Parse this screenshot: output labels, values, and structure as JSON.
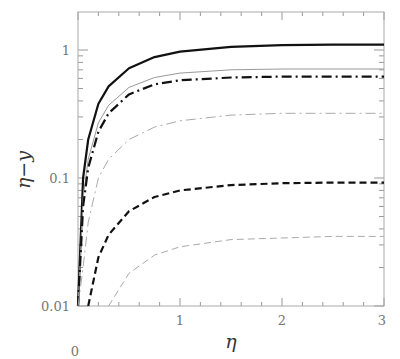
{
  "chart_data": {
    "type": "line",
    "title": "",
    "xlabel": "η",
    "ylabel": "η−y",
    "xlim": [
      0,
      3
    ],
    "ylim": [
      0.01,
      1.8
    ],
    "yscale": "log",
    "grid": false,
    "legend": null,
    "x_ticks": [
      "0",
      "1",
      "2",
      "3"
    ],
    "y_ticks": [
      "0.01",
      "0.1",
      "1"
    ],
    "x": [
      0.0,
      0.05,
      0.1,
      0.2,
      0.3,
      0.5,
      0.75,
      1.0,
      1.5,
      2.0,
      2.5,
      3.0
    ],
    "series": [
      {
        "name": "thick solid",
        "style": "solid",
        "color": "#111111",
        "width": 2.2,
        "values": [
          0.01,
          0.1,
          0.2,
          0.38,
          0.52,
          0.72,
          0.88,
          0.97,
          1.06,
          1.09,
          1.1,
          1.1
        ]
      },
      {
        "name": "thin solid",
        "style": "solid",
        "color": "#999999",
        "width": 1,
        "values": [
          0.01,
          0.07,
          0.14,
          0.27,
          0.37,
          0.51,
          0.61,
          0.66,
          0.7,
          0.71,
          0.71,
          0.71
        ]
      },
      {
        "name": "thick dash-dot",
        "style": "dashdot",
        "color": "#111111",
        "width": 2.2,
        "values": [
          0.01,
          0.06,
          0.12,
          0.23,
          0.32,
          0.45,
          0.54,
          0.58,
          0.61,
          0.62,
          0.62,
          0.62
        ]
      },
      {
        "name": "thin dash-dot",
        "style": "dashdot",
        "color": "#aaaaaa",
        "width": 1,
        "values": [
          0.01,
          0.02,
          0.045,
          0.1,
          0.14,
          0.2,
          0.25,
          0.28,
          0.31,
          0.32,
          0.32,
          0.32
        ]
      },
      {
        "name": "thick dashed",
        "style": "dashed",
        "color": "#111111",
        "width": 2.2,
        "values": [
          null,
          null,
          0.01,
          0.024,
          0.036,
          0.055,
          0.071,
          0.08,
          0.088,
          0.091,
          0.092,
          0.092
        ]
      },
      {
        "name": "thin dashed",
        "style": "dashed",
        "color": "#aaaaaa",
        "width": 1,
        "values": [
          null,
          null,
          null,
          null,
          0.01,
          0.018,
          0.025,
          0.029,
          0.033,
          0.034,
          0.035,
          0.035
        ]
      }
    ]
  }
}
